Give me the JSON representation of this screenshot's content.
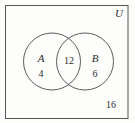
{
  "diagram": {
    "type": "venn",
    "universe": {
      "label": "U",
      "outside_count": "16",
      "frame": {
        "x": 5,
        "y": 5,
        "width": 123,
        "height": 113
      }
    },
    "sets": [
      {
        "name": "set-a",
        "label": "A",
        "only_count": "4",
        "circle": {
          "cx": 52,
          "cy": 61.5,
          "r": 28.5
        }
      },
      {
        "name": "set-b",
        "label": "B",
        "only_count": "6",
        "circle": {
          "cx": 85,
          "cy": 61.5,
          "r": 28.5
        }
      }
    ],
    "intersection": {
      "label": "A-and-B",
      "count": "12"
    },
    "colors": {
      "stroke": "#4a4a4a",
      "frame_stroke": "#555555",
      "text": "#2b2b2b",
      "background": "#fdfdfc"
    }
  }
}
